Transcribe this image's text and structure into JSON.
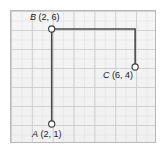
{
  "figure": {
    "kind": "coordinate-grid-diagram",
    "background_color": "#ffffff",
    "panel_fill": "#f2f2f2",
    "panel_border_color": "#b9b9b9",
    "minor_grid_color": "#e2e2e2",
    "major_grid_color": "#c4c4c4",
    "path_color": "#4a4a4a",
    "marker_fill": "#ffffff",
    "marker_stroke": "#3d3d3d"
  },
  "chart_data": {
    "type": "scatter",
    "title": "",
    "subtitle": "",
    "xlabel": "",
    "ylabel": "",
    "xlim": [
      0,
      7
    ],
    "ylim": [
      0,
      7
    ],
    "grid": true,
    "grid_major_step": 1,
    "grid_minor_step": 0.5,
    "axis_tick_labels_shown": false,
    "legend": null,
    "points": [
      {
        "name": "A",
        "x": 2,
        "y": 1,
        "label": "A (2, 1)",
        "label_position": "below-left"
      },
      {
        "name": "B",
        "x": 2,
        "y": 6,
        "label": "B (2, 6)",
        "label_position": "above-left"
      },
      {
        "name": "C",
        "x": 6,
        "y": 4,
        "label": "C (6, 4)",
        "label_position": "below-left"
      }
    ],
    "polyline": {
      "name": "path-A-B-corner-C",
      "vertices": [
        {
          "x": 2,
          "y": 1
        },
        {
          "x": 2,
          "y": 6
        },
        {
          "x": 6,
          "y": 6
        },
        {
          "x": 6,
          "y": 4
        }
      ],
      "closed": false,
      "stroke_color": "#4a4a4a",
      "stroke_width": 1.6
    },
    "annotations": [
      {
        "text": "B (2, 6)",
        "at": [
          2,
          6
        ]
      },
      {
        "text": "C (6, 4)",
        "at": [
          6,
          4
        ]
      },
      {
        "text": "A (2, 1)",
        "at": [
          2,
          1
        ]
      }
    ]
  },
  "labels": {
    "point_a": {
      "name": "A",
      "coords": " (2, 1)",
      "full": "A (2, 1)"
    },
    "point_b": {
      "name": "B",
      "coords": " (2, 6)",
      "full": "B (2, 6)"
    },
    "point_c": {
      "name": "C",
      "coords": " (6, 4)",
      "full": "C (6, 4)"
    }
  }
}
